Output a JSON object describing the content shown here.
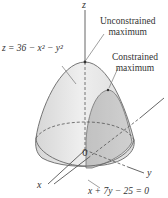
{
  "figure": {
    "surface_equation": "z = 36 − x² − y²",
    "constraint_equation": "x + 7y − 25 = 0",
    "annotations": {
      "unconstrained": [
        "Unconstrained",
        "maximum"
      ],
      "constrained": [
        "Constrained",
        "maximum"
      ]
    },
    "axes": {
      "x": "x",
      "y": "y",
      "z": "z",
      "origin": "0"
    },
    "colors": {
      "surface_fill": "#e4e4e4",
      "constraint_fill": "#c9c9c9",
      "base_fill": "#dedede",
      "line": "#555555",
      "text": "#333333"
    }
  }
}
